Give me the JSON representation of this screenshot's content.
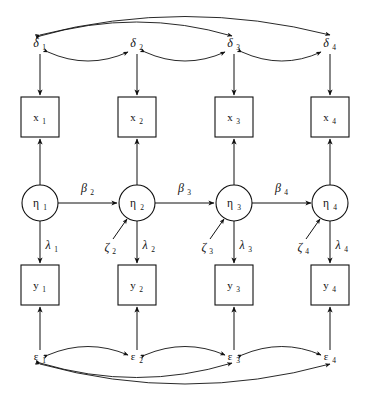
{
  "diagram": {
    "type": "path-diagram",
    "background_color": "#ffffff",
    "stroke_color": "#111111",
    "rows": {
      "delta_row": "measurement errors for x indicators",
      "x_row": "observed x indicators",
      "eta_row": "latent variables",
      "y_row": "observed y indicators",
      "epsilon_row": "measurement errors for y indicators"
    },
    "columns": 4,
    "delta": [
      {
        "symbol": "δ",
        "sub": "1"
      },
      {
        "symbol": "δ",
        "sub": "2"
      },
      {
        "symbol": "δ",
        "sub": "3"
      },
      {
        "symbol": "δ",
        "sub": "4"
      }
    ],
    "x_indicators": [
      {
        "symbol": "x",
        "sub": "1"
      },
      {
        "symbol": "x",
        "sub": "2"
      },
      {
        "symbol": "x",
        "sub": "3"
      },
      {
        "symbol": "x",
        "sub": "4"
      }
    ],
    "eta_latents": [
      {
        "symbol": "η",
        "sub": "1"
      },
      {
        "symbol": "η",
        "sub": "2"
      },
      {
        "symbol": "η",
        "sub": "3"
      },
      {
        "symbol": "η",
        "sub": "4"
      }
    ],
    "y_indicators": [
      {
        "symbol": "y",
        "sub": "1"
      },
      {
        "symbol": "y",
        "sub": "2"
      },
      {
        "symbol": "y",
        "sub": "3"
      },
      {
        "symbol": "y",
        "sub": "4"
      }
    ],
    "epsilon": [
      {
        "symbol": "ε",
        "sub": "1"
      },
      {
        "symbol": "ε",
        "sub": "2"
      },
      {
        "symbol": "ε",
        "sub": "3"
      },
      {
        "symbol": "ε",
        "sub": "4"
      }
    ],
    "beta_paths": [
      {
        "symbol": "β",
        "sub": "2",
        "from": "η1",
        "to": "η2"
      },
      {
        "symbol": "β",
        "sub": "3",
        "from": "η2",
        "to": "η3"
      },
      {
        "symbol": "β",
        "sub": "4",
        "from": "η3",
        "to": "η4"
      }
    ],
    "lambda_paths": [
      {
        "symbol": "λ",
        "sub": "1",
        "from": "η1",
        "to": "y1"
      },
      {
        "symbol": "λ",
        "sub": "2",
        "from": "η2",
        "to": "y2"
      },
      {
        "symbol": "λ",
        "sub": "3",
        "from": "η3",
        "to": "y3"
      },
      {
        "symbol": "λ",
        "sub": "4",
        "from": "η4",
        "to": "y4"
      }
    ],
    "zeta_disturbances": [
      {
        "symbol": "ζ",
        "sub": "2",
        "to": "η2"
      },
      {
        "symbol": "ζ",
        "sub": "3",
        "to": "η3"
      },
      {
        "symbol": "ζ",
        "sub": "4",
        "to": "η4"
      }
    ],
    "delta_correlations": [
      {
        "from": "δ1",
        "to": "δ2",
        "kind": "adjacent"
      },
      {
        "from": "δ2",
        "to": "δ3",
        "kind": "adjacent"
      },
      {
        "from": "δ3",
        "to": "δ4",
        "kind": "adjacent"
      },
      {
        "from": "δ1",
        "to": "δ3",
        "kind": "long"
      },
      {
        "from": "δ1",
        "to": "δ4",
        "kind": "long"
      }
    ],
    "epsilon_correlations": [
      {
        "from": "ε1",
        "to": "ε2",
        "kind": "adjacent"
      },
      {
        "from": "ε2",
        "to": "ε3",
        "kind": "adjacent"
      },
      {
        "from": "ε3",
        "to": "ε4",
        "kind": "adjacent"
      },
      {
        "from": "ε1",
        "to": "ε3",
        "kind": "long"
      },
      {
        "from": "ε1",
        "to": "ε4",
        "kind": "long"
      }
    ]
  }
}
